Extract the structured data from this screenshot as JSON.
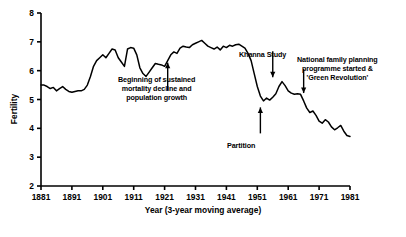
{
  "chart_data": {
    "type": "line",
    "title": "",
    "xlabel": "Year (3-year moving average)",
    "ylabel": "Fertility",
    "xlim": [
      1881,
      1981
    ],
    "ylim": [
      2,
      8
    ],
    "xticks": [
      1881,
      1891,
      1901,
      1911,
      1921,
      1931,
      1941,
      1951,
      1961,
      1971,
      1981
    ],
    "yticks": [
      2,
      3,
      4,
      5,
      6,
      7,
      8
    ],
    "grid": false,
    "legend": null,
    "series": [
      {
        "name": "Fertility (3-year moving average)",
        "x": [
          1881,
          1882,
          1883,
          1884,
          1885,
          1886,
          1887,
          1888,
          1889,
          1890,
          1891,
          1892,
          1893,
          1894,
          1895,
          1896,
          1897,
          1898,
          1899,
          1900,
          1901,
          1902,
          1903,
          1904,
          1905,
          1906,
          1907,
          1908,
          1909,
          1910,
          1911,
          1912,
          1913,
          1914,
          1915,
          1916,
          1917,
          1918,
          1919,
          1920,
          1921,
          1922,
          1923,
          1924,
          1925,
          1926,
          1927,
          1928,
          1929,
          1930,
          1931,
          1932,
          1933,
          1934,
          1935,
          1936,
          1937,
          1938,
          1939,
          1940,
          1941,
          1942,
          1943,
          1944,
          1945,
          1946,
          1947,
          1948,
          1949,
          1950,
          1951,
          1952,
          1953,
          1954,
          1955,
          1956,
          1957,
          1958,
          1959,
          1960,
          1961,
          1962,
          1963,
          1964,
          1965,
          1966,
          1967,
          1968,
          1969,
          1970,
          1971,
          1972,
          1973,
          1974,
          1975,
          1976,
          1977,
          1978,
          1979,
          1980,
          1981
        ],
        "y": [
          5.5,
          5.5,
          5.45,
          5.38,
          5.42,
          5.3,
          5.38,
          5.45,
          5.35,
          5.28,
          5.25,
          5.28,
          5.3,
          5.3,
          5.35,
          5.5,
          5.8,
          6.15,
          6.35,
          6.45,
          6.55,
          6.45,
          6.6,
          6.75,
          6.72,
          6.45,
          6.3,
          6.15,
          6.75,
          6.8,
          6.78,
          6.55,
          6.1,
          5.9,
          5.8,
          5.95,
          6.1,
          6.25,
          6.22,
          6.2,
          6.15,
          6.35,
          6.55,
          6.65,
          6.6,
          6.78,
          6.85,
          6.82,
          6.8,
          6.9,
          6.95,
          7.0,
          7.05,
          6.95,
          6.85,
          6.8,
          6.75,
          6.82,
          6.72,
          6.85,
          6.8,
          6.88,
          6.85,
          6.9,
          6.92,
          6.85,
          6.78,
          6.6,
          6.35,
          5.9,
          5.45,
          5.12,
          4.95,
          5.05,
          4.98,
          5.08,
          5.2,
          5.45,
          5.62,
          5.48,
          5.3,
          5.22,
          5.18,
          5.2,
          5.18,
          4.95,
          4.7,
          4.55,
          4.6,
          4.45,
          4.25,
          4.18,
          4.3,
          4.22,
          4.05,
          3.95,
          4.02,
          4.1,
          3.9,
          3.75,
          3.72
        ]
      }
    ],
    "annotations": [
      {
        "id": "mortality",
        "lines": [
          "Beginning of sustained",
          "mortality decline and",
          "population growth"
        ],
        "arrow_target_year": 1922,
        "arrow_target_value": 6.45
      },
      {
        "id": "khanna",
        "lines": [
          "Khanna Study"
        ],
        "arrow_target_year": 1956,
        "arrow_target_value": 5.6
      },
      {
        "id": "national-family-planning",
        "lines": [
          "National family planning",
          "programme started &",
          "'Green Revolution'"
        ],
        "arrow_target_year": 1966,
        "arrow_target_value": 5.05
      },
      {
        "id": "partition",
        "lines": [
          "Partition"
        ],
        "arrow_target_year": 1952,
        "arrow_target_value": 4.9
      }
    ]
  },
  "axis": {
    "ylabel": "Fertility",
    "xlabel": "Year (3-year moving average)",
    "ytick_labels": [
      "8",
      "7",
      "6",
      "5",
      "4",
      "3",
      "2"
    ],
    "xtick_labels": [
      "1881",
      "1891",
      "1901",
      "1911",
      "1921",
      "1931",
      "1941",
      "1951",
      "1961",
      "1971",
      "1981"
    ]
  },
  "annotations": {
    "mortality": {
      "line1": "Beginning of sustained",
      "line2": "mortality decline and",
      "line3": "population growth"
    },
    "khanna": {
      "line1": "Khanna Study"
    },
    "nfp": {
      "line1": "National family planning",
      "line2": "programme started &",
      "line3": "'Green Revolution'"
    },
    "partition": {
      "line1": "Partition"
    }
  },
  "colors": {
    "line": "#000000",
    "axis": "#000000",
    "background": "#ffffff"
  }
}
